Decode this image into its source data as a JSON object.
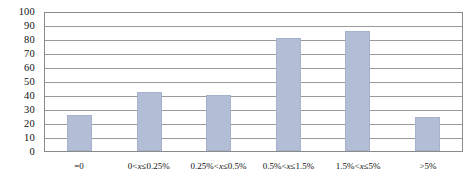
{
  "chart_data": {
    "type": "bar",
    "title": "",
    "subtitle": "",
    "xlabel": "",
    "ylabel": "",
    "ylim": [
      0,
      100
    ],
    "ytick_step": 10,
    "yticks": [
      "100",
      "90",
      "80",
      "70",
      "60",
      "50",
      "40",
      "30",
      "20",
      "10",
      "0"
    ],
    "grid": true,
    "legend": "none",
    "categories": [
      "=0",
      "0<x≤0.25%",
      "0.25%<x≤0.5%",
      "0.5%<x≤1.5%",
      "1.5%<x≤5%",
      ">5%"
    ],
    "values": [
      26,
      42,
      40,
      81,
      86,
      24
    ],
    "series": [
      {
        "name": "Count",
        "values": [
          26,
          42,
          40,
          81,
          86,
          24
        ]
      }
    ],
    "colors": {
      "bar_fill": "#b3bed6",
      "bar_border": "#a6b2cc",
      "gridline": "#9a9a9a",
      "axis_border": "#8a8a8a",
      "text": "#111111",
      "background": "#ffffff"
    }
  }
}
